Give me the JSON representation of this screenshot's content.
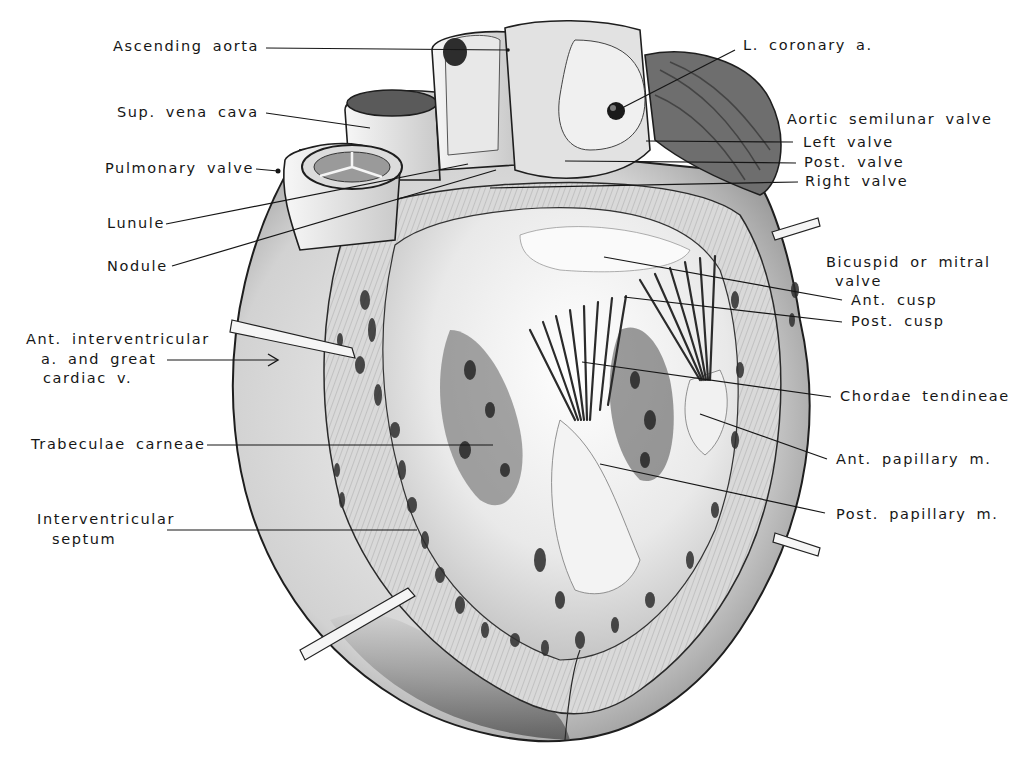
{
  "figure": {
    "colors": {
      "ink": "#161616",
      "tissue_light": "#ededed",
      "tissue_mid": "#b9b9b9",
      "tissue_dark": "#3a3a3a",
      "background": "#ffffff"
    }
  },
  "labels_left": [
    {
      "id": "ascending-aorta",
      "text": "Ascending aorta"
    },
    {
      "id": "sup-vena-cava",
      "text": "Sup. vena cava"
    },
    {
      "id": "pulmonary-valve",
      "text": "Pulmonary valve"
    },
    {
      "id": "lunule",
      "text": "Lunule"
    },
    {
      "id": "nodule",
      "text": "Nodule"
    },
    {
      "id": "ant-interventricular-1",
      "text": "Ant. interventricular"
    },
    {
      "id": "ant-interventricular-2",
      "text": "a. and great"
    },
    {
      "id": "ant-interventricular-3",
      "text": "cardiac v."
    },
    {
      "id": "trabeculae-carneae",
      "text": "Trabeculae carneae"
    },
    {
      "id": "interventricular-septum-1",
      "text": "Interventricular"
    },
    {
      "id": "interventricular-septum-2",
      "text": "septum"
    }
  ],
  "labels_right": [
    {
      "id": "l-coronary-a",
      "text": "L. coronary a."
    },
    {
      "id": "aortic-semilunar-valve",
      "text": "Aortic semilunar valve"
    },
    {
      "id": "left-valve",
      "text": "Left valve"
    },
    {
      "id": "post-valve",
      "text": "Post. valve"
    },
    {
      "id": "right-valve",
      "text": "Right valve"
    },
    {
      "id": "bicuspid-1",
      "text": "Bicuspid or mitral"
    },
    {
      "id": "bicuspid-2",
      "text": "valve"
    },
    {
      "id": "ant-cusp",
      "text": "Ant. cusp"
    },
    {
      "id": "post-cusp",
      "text": "Post. cusp"
    },
    {
      "id": "chordae-tendineae",
      "text": "Chordae tendineae"
    },
    {
      "id": "ant-papillary-m",
      "text": "Ant. papillary m."
    },
    {
      "id": "post-papillary-m",
      "text": "Post. papillary m."
    }
  ]
}
